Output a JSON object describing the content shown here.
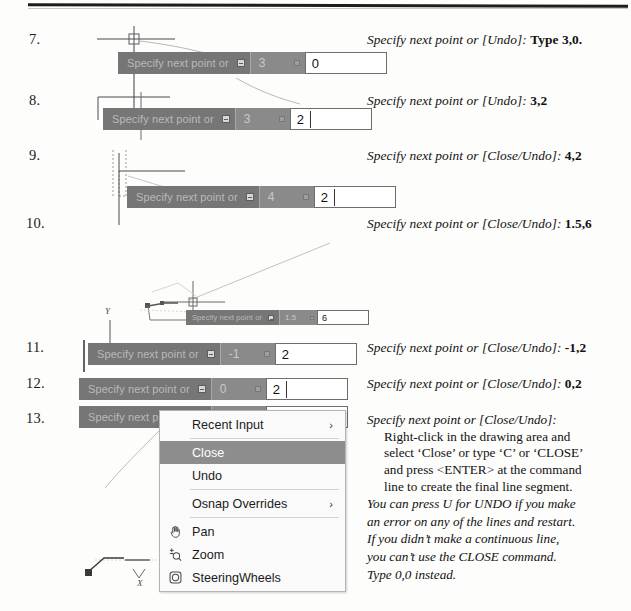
{
  "steps": [
    {
      "num": "7.",
      "prompt_lead": "Specify next point or [Undo]:",
      "prompt_value": "Type 3,0.",
      "tooltip": {
        "command": "Specify next point or",
        "x": "3",
        "y": "0"
      }
    },
    {
      "num": "8.",
      "prompt_lead": "Specify next point or [Undo]:",
      "prompt_value": "3,2",
      "tooltip": {
        "command": "Specify next point or",
        "x": "3",
        "y": "2"
      }
    },
    {
      "num": "9.",
      "prompt_lead": "Specify next point or [Close/Undo]:",
      "prompt_value": "4,2",
      "tooltip": {
        "command": "Specify next point or",
        "x": "4",
        "y": "2"
      }
    },
    {
      "num": "10.",
      "prompt_lead": "Specify next point or [Close/Undo]:",
      "prompt_value": "1.5,6",
      "tooltip": {
        "command": "Specify next point or",
        "x": "1.5",
        "y": "6"
      }
    },
    {
      "num": "11.",
      "prompt_lead": "Specify next point or [Close/Undo]:",
      "prompt_value": "-1,2",
      "tooltip": {
        "command": "Specify next point or",
        "x": "-1",
        "y": "2"
      }
    },
    {
      "num": "12.",
      "prompt_lead": "Specify next point or [Close/Undo]:",
      "prompt_value": "0,2",
      "tooltip": {
        "command": "Specify next point or",
        "x": "0",
        "y": "2"
      }
    },
    {
      "num": "13.",
      "prompt_lead": "Specify next point or [Close/Undo]:",
      "prompt_value": ""
    }
  ],
  "context_menu": {
    "items": [
      {
        "label": "Recent Input",
        "icon": "",
        "submenu": "›",
        "selected": false
      },
      {
        "label": "Close",
        "icon": "",
        "submenu": "",
        "selected": true
      },
      {
        "label": "Undo",
        "icon": "",
        "submenu": "",
        "selected": false
      },
      {
        "label": "Osnap Overrides",
        "icon": "",
        "submenu": "›",
        "selected": false
      },
      {
        "label": "Pan",
        "icon": "hand-icon",
        "submenu": "",
        "selected": false
      },
      {
        "label": "Zoom",
        "icon": "zoom-icon",
        "submenu": "",
        "selected": false
      },
      {
        "label": "SteeringWheels",
        "icon": "steeringwheel-icon",
        "submenu": "",
        "selected": false
      }
    ]
  },
  "note": {
    "header": "Specify next point or [Close/Undo]:",
    "body_line1": "Right-click in the drawing area and",
    "body_line2": "select ‘Close’ or type ‘C’ or ‘CLOSE’",
    "body_line3": "and press <ENTER> at the command",
    "body_line4": "line to create the final line segment.",
    "tail_line1": "You can press U for UNDO if you make",
    "tail_line2": "an error on any of the lines and restart.",
    "tail_line3": "If you didn’t make a continuous line,",
    "tail_line4": "you can’t use the CLOSE command.",
    "tail_line5": "Type 0,0 instead."
  },
  "axis_labels": {
    "y": "Y",
    "x": "X"
  },
  "colors": {
    "tooltip_bg": "#767676",
    "tooltip_field_bg": "#8a8a8a",
    "tooltip_input_bg": "#ffffff",
    "menu_highlight": "#8d8d8d",
    "page_bg": "#fdfdfc"
  }
}
